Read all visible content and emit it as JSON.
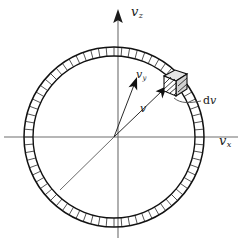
{
  "figure": {
    "background_color": "#ffffff",
    "ink_color": "#111111",
    "axis_color": "#6e6e6e",
    "axes": [
      {
        "name": "vertical-axis",
        "symbol": "v",
        "subscript": "z",
        "label": "v_z",
        "orientation": "vertical",
        "arrow": "up"
      },
      {
        "name": "horizontal-axis",
        "symbol": "v",
        "subscript": "x",
        "label": "v_x",
        "orientation": "horizontal",
        "arrow": "none"
      }
    ],
    "vectors": [
      {
        "name": "vy-vector",
        "symbol": "v",
        "subscript": "y",
        "label": "v_y",
        "description": "arrow from origin toward upper right interior"
      },
      {
        "name": "v-vector",
        "symbol": "v",
        "subscript": "",
        "label": "v",
        "description": "arrow from origin to the volume element on the shell"
      }
    ],
    "annotations": [
      {
        "name": "dv-callout",
        "prefix": "d",
        "symbol": "v",
        "label": "dv",
        "description": "leader line pointing to the hatched volume element"
      }
    ],
    "shell": {
      "name": "spherical-shell",
      "description": "hatched annular shell representing speed interval",
      "center_x": 114,
      "center_y": 137,
      "outer_radius": 90,
      "inner_radius": 81,
      "hatch_count": 72
    },
    "element": {
      "name": "volume-element",
      "description": "small hatched cube on the shell at approximately 55 degrees",
      "angle_deg": 55
    }
  }
}
